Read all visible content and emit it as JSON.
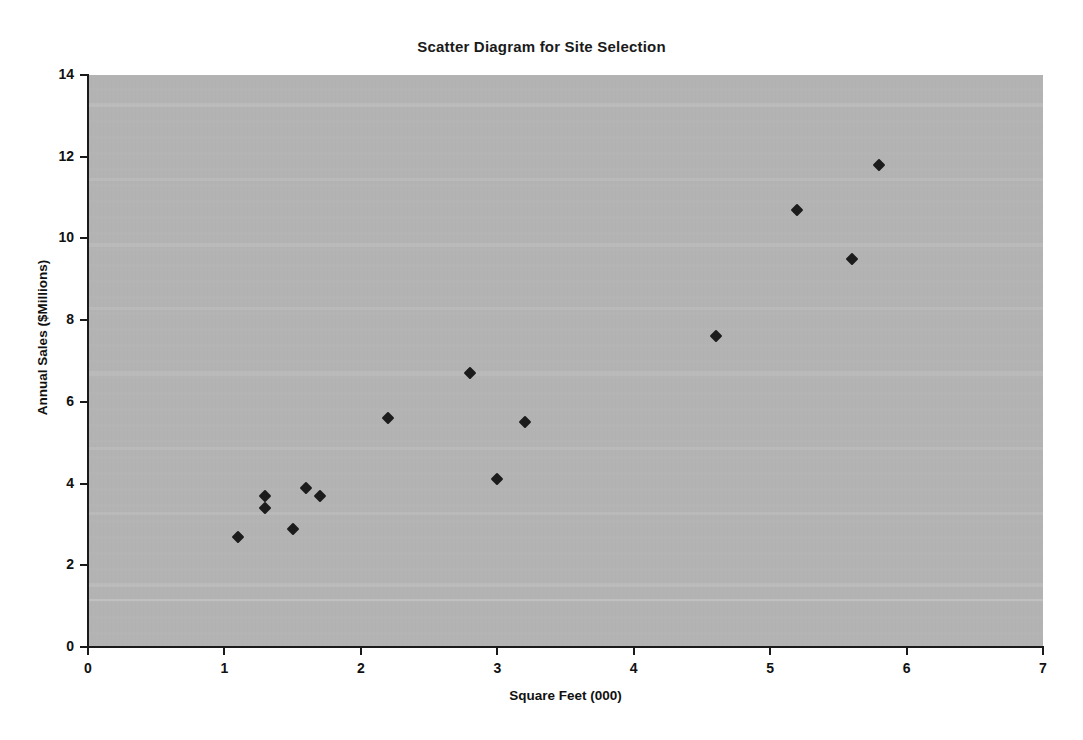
{
  "chart_data": {
    "type": "scatter",
    "title": "Scatter Diagram for Site Selection",
    "xlabel": "Square Feet (000)",
    "ylabel": "Annual Sales ($Millions)",
    "xlim": [
      0,
      7
    ],
    "ylim": [
      0,
      14
    ],
    "xticks": [
      "0",
      "1",
      "2",
      "3",
      "4",
      "5",
      "6",
      "7"
    ],
    "yticks": [
      "0",
      "2",
      "4",
      "6",
      "8",
      "10",
      "12",
      "14"
    ],
    "grid": false,
    "legend": null,
    "marker": "diamond",
    "marker_color": "#1c1c1c",
    "plot_background": "#b3b3b3",
    "points": [
      {
        "x": 1.1,
        "y": 2.7
      },
      {
        "x": 1.3,
        "y": 3.4
      },
      {
        "x": 1.3,
        "y": 3.7
      },
      {
        "x": 1.5,
        "y": 2.9
      },
      {
        "x": 1.6,
        "y": 3.9
      },
      {
        "x": 1.7,
        "y": 3.7
      },
      {
        "x": 2.2,
        "y": 5.6
      },
      {
        "x": 2.8,
        "y": 6.7
      },
      {
        "x": 3.0,
        "y": 4.1
      },
      {
        "x": 3.2,
        "y": 5.5
      },
      {
        "x": 4.6,
        "y": 7.6
      },
      {
        "x": 5.2,
        "y": 10.7
      },
      {
        "x": 5.6,
        "y": 9.5
      },
      {
        "x": 5.8,
        "y": 11.8
      }
    ]
  }
}
